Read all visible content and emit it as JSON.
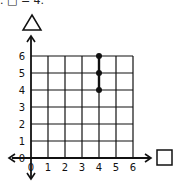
{
  "header": {
    "text": ". □ = 4."
  },
  "chart_data": {
    "type": "scatter",
    "title": "",
    "xlabel": "□",
    "ylabel": "△",
    "xlim": [
      0,
      6
    ],
    "ylim": [
      0,
      6
    ],
    "grid": true,
    "x_ticks": [
      "0",
      "1",
      "2",
      "3",
      "4",
      "5",
      "6"
    ],
    "y_ticks": [
      "0",
      "1",
      "2",
      "3",
      "4",
      "5",
      "6"
    ],
    "points": [
      {
        "x": 4,
        "y": 6
      },
      {
        "x": 4,
        "y": 5
      },
      {
        "x": 4,
        "y": 4
      }
    ],
    "highlight_segment": {
      "x": 4,
      "y_from": 4,
      "y_to": 6
    }
  },
  "colors": {
    "ink": "#111111",
    "grid": "#222222",
    "background": "#ffffff"
  }
}
